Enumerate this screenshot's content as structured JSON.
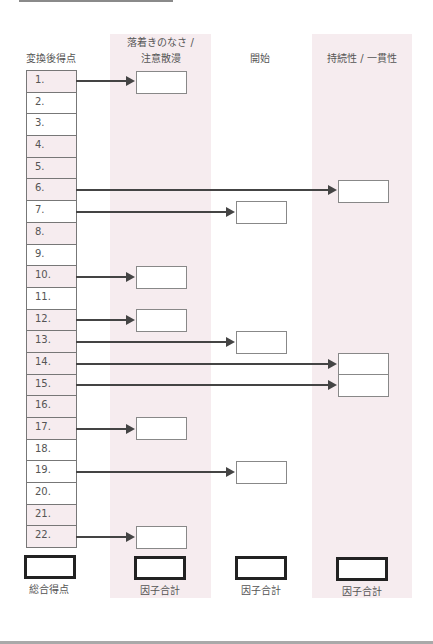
{
  "headers": {
    "score_column": "変換後得点",
    "factor1_line1": "落着きのなさ /",
    "factor1_line2": "注意散漫",
    "factor2": "開始",
    "factor3": "持続性 / 一貫性"
  },
  "rows": [
    {
      "label": "1.",
      "shaded": true,
      "target": "factor1"
    },
    {
      "label": "2.",
      "shaded": false,
      "target": null
    },
    {
      "label": "3.",
      "shaded": false,
      "target": null
    },
    {
      "label": "4.",
      "shaded": true,
      "target": null
    },
    {
      "label": "5.",
      "shaded": true,
      "target": null
    },
    {
      "label": "6.",
      "shaded": true,
      "target": "factor3"
    },
    {
      "label": "7.",
      "shaded": false,
      "target": "factor2"
    },
    {
      "label": "8.",
      "shaded": true,
      "target": null
    },
    {
      "label": "9.",
      "shaded": false,
      "target": null
    },
    {
      "label": "10.",
      "shaded": true,
      "target": "factor1"
    },
    {
      "label": "11.",
      "shaded": false,
      "target": null
    },
    {
      "label": "12.",
      "shaded": true,
      "target": "factor1"
    },
    {
      "label": "13.",
      "shaded": true,
      "target": "factor2"
    },
    {
      "label": "14.",
      "shaded": true,
      "target": "factor3"
    },
    {
      "label": "15.",
      "shaded": true,
      "target": "factor3"
    },
    {
      "label": "16.",
      "shaded": true,
      "target": null
    },
    {
      "label": "17.",
      "shaded": true,
      "target": "factor1"
    },
    {
      "label": "18.",
      "shaded": false,
      "target": null
    },
    {
      "label": "19.",
      "shaded": false,
      "target": "factor2"
    },
    {
      "label": "20.",
      "shaded": false,
      "target": null
    },
    {
      "label": "21.",
      "shaded": true,
      "target": null
    },
    {
      "label": "22.",
      "shaded": true,
      "target": "factor1"
    }
  ],
  "footer": {
    "total_label": "総合得点",
    "factor1_label": "因子合計",
    "factor2_label": "因子合計",
    "factor3_label": "因子合計"
  },
  "colors": {
    "band": "#f6ecef",
    "arrow": "#444444",
    "border": "#777777"
  }
}
